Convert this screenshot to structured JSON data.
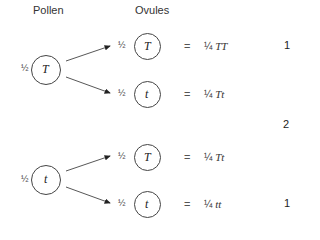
{
  "headers": {
    "pollen": "Pollen",
    "ovules": "Ovules"
  },
  "pollen": [
    {
      "fraction": "½",
      "allele": "T"
    },
    {
      "fraction": "½",
      "allele": "t"
    }
  ],
  "crosses": [
    {
      "fraction": "½",
      "allele": "T",
      "equals": "=",
      "prob": "¼",
      "genotype": "TT"
    },
    {
      "fraction": "½",
      "allele": "t",
      "equals": "=",
      "prob": "¼",
      "genotype": "Tt"
    },
    {
      "fraction": "½",
      "allele": "T",
      "equals": "=",
      "prob": "¼",
      "genotype": "Tt"
    },
    {
      "fraction": "½",
      "allele": "t",
      "equals": "=",
      "prob": "¼",
      "genotype": "tt"
    }
  ],
  "ratios": [
    "1",
    "2",
    "1"
  ]
}
